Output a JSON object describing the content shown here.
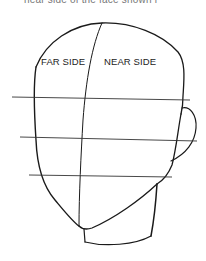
{
  "caption": "near side of the face shown i",
  "labels": {
    "far_side": "FAR SIDE",
    "near_side": "NEAR SIDE"
  },
  "colors": {
    "line": "#1a1a1a",
    "guide": "#333333",
    "background": "#ffffff"
  }
}
